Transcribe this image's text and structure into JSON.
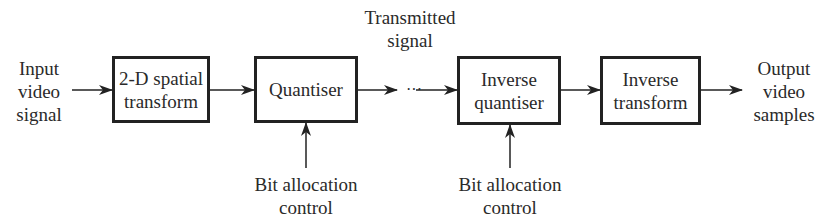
{
  "diagram": {
    "type": "block-diagram",
    "input_label": "Input\nvideo\nsignal",
    "output_label": "Output\nvideo\nsamples",
    "transmitted_label": "Transmitted\nsignal",
    "ellipsis": "···",
    "blocks": [
      {
        "id": "spatial-transform",
        "label": "2-D spatial\ntransform"
      },
      {
        "id": "quantiser",
        "label": "Quantiser"
      },
      {
        "id": "inverse-quantiser",
        "label": "Inverse\nquantiser"
      },
      {
        "id": "inverse-transform",
        "label": "Inverse\ntransform"
      }
    ],
    "control_inputs": [
      {
        "target": "quantiser",
        "label": "Bit allocation\ncontrol"
      },
      {
        "target": "inverse-quantiser",
        "label": "Bit allocation\ncontrol"
      }
    ],
    "colors": {
      "line": "#222222",
      "text": "#2a2a2a",
      "background": "#ffffff"
    }
  }
}
